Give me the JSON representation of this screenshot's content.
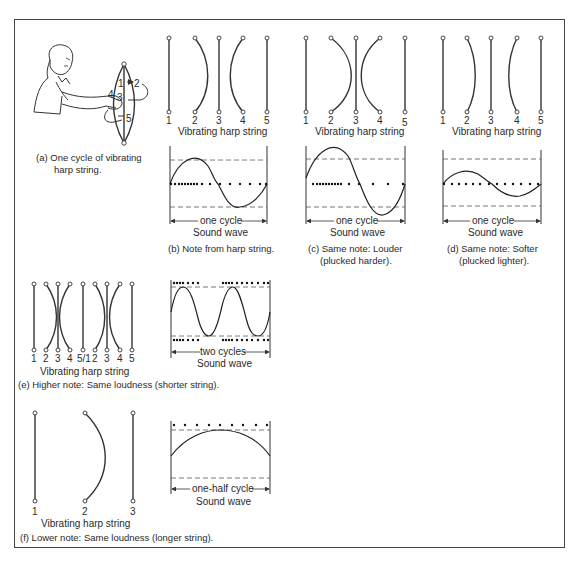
{
  "figure": {
    "panels": [
      {
        "id": "a",
        "caption_line1": "(a)  One cycle of vibrating",
        "caption_line2": "harp string.",
        "string_labels": [
          "1",
          "2",
          "3",
          "4",
          "5"
        ]
      },
      {
        "id": "b",
        "strings_title": "Vibrating harp string",
        "string_labels": [
          "1",
          "2",
          "3",
          "4",
          "5"
        ],
        "cycle_label": "one cycle",
        "wave_title": "Sound wave",
        "caption_line1": "(b)  Note from harp string.",
        "caption_line2": ""
      },
      {
        "id": "c",
        "strings_title": "Vibrating harp string",
        "string_labels": [
          "1",
          "2",
          "3",
          "4",
          "5"
        ],
        "cycle_label": "one cycle",
        "wave_title": "Sound wave",
        "caption_line1": "(c)  Same note:  Louder",
        "caption_line2": "(plucked harder)."
      },
      {
        "id": "d",
        "strings_title": "Vibrating harp string",
        "string_labels": [
          "1",
          "2",
          "3",
          "4",
          "5"
        ],
        "cycle_label": "one cycle",
        "wave_title": "Sound wave",
        "caption_line1": "(d)  Same note:  Softer",
        "caption_line2": "(plucked lighter)."
      },
      {
        "id": "e",
        "strings_title": "Vibrating harp string",
        "string_labels": [
          "1",
          "2",
          "3",
          "4",
          "5/1",
          "2",
          "3",
          "4",
          "5"
        ],
        "cycle_label": "two cycles",
        "wave_title": "Sound wave",
        "caption_line1": "(e)  Higher note:  Same loudness (shorter string)."
      },
      {
        "id": "f",
        "strings_title": "Vibrating harp string",
        "string_labels": [
          "1",
          "2",
          "3"
        ],
        "cycle_label": "one-half cycle",
        "wave_title": "Sound wave",
        "caption_line1": "(f)  Lower note:  Same loudness (longer string)."
      }
    ]
  }
}
